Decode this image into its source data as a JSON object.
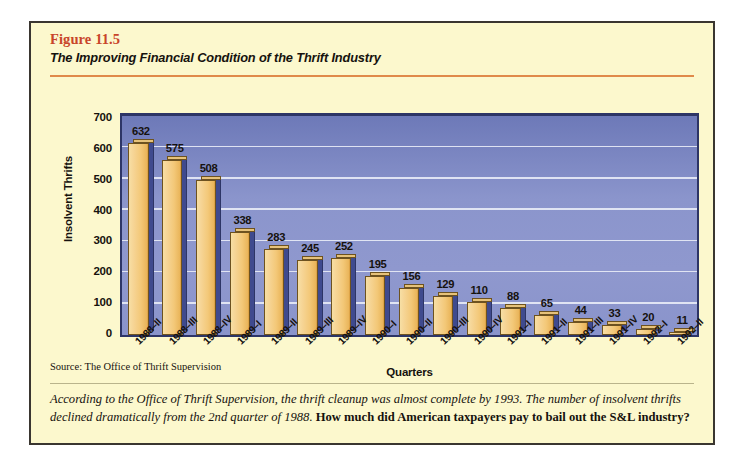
{
  "figure": {
    "number": "Figure 11.5",
    "title": "The Improving Financial Condition of the Thrift Industry",
    "source_note": "Source: The Office of Thrift Supervision",
    "caption_lead": "According to the Office of Thrift Supervision, the thrift cleanup was almost complete by 1993. The number of insolvent thrifts declined dramatically from the 2nd quarter of 1988.",
    "caption_question": "How much did American taxpayers pay to bail out the S&L industry?"
  },
  "colors": {
    "panel_background": "#fcf8cd",
    "frame_border": "#3a3630",
    "figure_number": "#c8452a",
    "header_rule": "#e08a4a",
    "plot_background": "#8b95cc",
    "plot_border": "#2d3566",
    "gridline": "#e7eaf6",
    "bar_face": "#f3c878",
    "bar_shadow": "#3f4a8e",
    "text": "#16120e"
  },
  "chart_data": {
    "type": "bar",
    "title": "The Improving Financial Condition of the Thrift Industry",
    "xlabel": "Quarters",
    "ylabel": "Insolvent Thrifts",
    "ylim": [
      0,
      700
    ],
    "yticks": [
      0,
      100,
      200,
      300,
      400,
      500,
      600,
      700
    ],
    "grid": true,
    "legend": false,
    "categories": [
      "1988–II",
      "1988–III",
      "1988–IV",
      "1989–I",
      "1989–II",
      "1989–III",
      "1989–IV",
      "1990–I",
      "1990–II",
      "1990–III",
      "1990–IV",
      "1991–I",
      "1991–II",
      "1991–III",
      "1991–IV",
      "1992–I",
      "1992–II"
    ],
    "values": [
      632,
      575,
      508,
      338,
      283,
      245,
      252,
      195,
      156,
      129,
      110,
      88,
      65,
      44,
      33,
      20,
      11
    ]
  }
}
